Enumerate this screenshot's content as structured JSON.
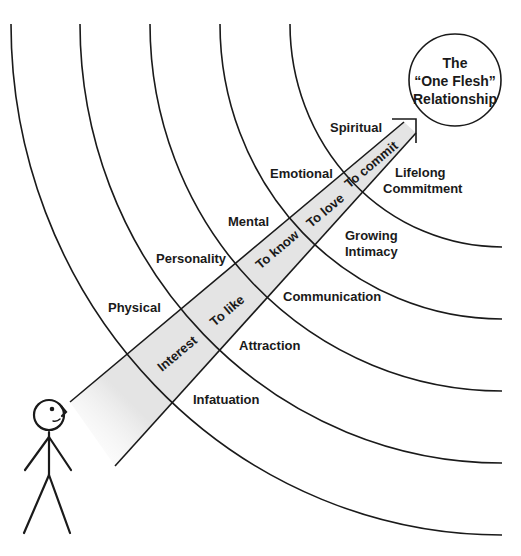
{
  "diagram": {
    "title": "The “One Flesh” Relationship",
    "goal_circle": {
      "lines": [
        "The",
        "“One Flesh”",
        "Relationship"
      ]
    },
    "levels": [
      {
        "area": "Physical",
        "stage": "Interest",
        "outcome": "Infatuation"
      },
      {
        "area": "Personality",
        "stage": "To like",
        "outcome": "Attraction"
      },
      {
        "area": "Mental",
        "stage": "To know",
        "outcome": "Communication"
      },
      {
        "area": "Emotional",
        "stage": "To love",
        "outcome": "Growing Intimacy"
      },
      {
        "area": "Spiritual",
        "stage": "To commit",
        "outcome": "Lifelong Commitment"
      }
    ],
    "labels": {
      "physical": "Physical",
      "personality": "Personality",
      "mental": "Mental",
      "emotional": "Emotional",
      "spiritual": "Spiritual",
      "interest": "Interest",
      "to_like": "To like",
      "to_know": "To know",
      "to_love": "To love",
      "to_commit": "To commit",
      "infatuation": "Infatuation",
      "attraction": "Attraction",
      "communication": "Communication",
      "growing_1": "Growing",
      "growing_2": "Intimacy",
      "lifelong_1": "Lifelong",
      "lifelong_2": "Commitment",
      "circle_1": "The",
      "circle_2": "“One Flesh”",
      "circle_3": "Relationship"
    },
    "figure": "stick-figure-person",
    "colors": {
      "line": "#1a1a1a",
      "band_fill": "#e4e4e4",
      "background": "#ffffff"
    }
  }
}
